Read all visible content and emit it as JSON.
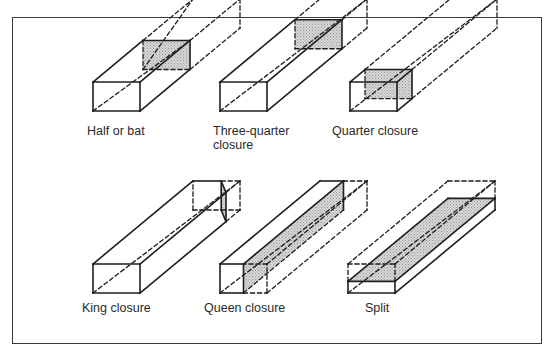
{
  "figure": {
    "type": "brick-cuts-diagram",
    "shade_color": "#c8c8c8",
    "line_color": "#1e1e1e",
    "items": [
      {
        "id": "half-or-bat",
        "label_lines": [
          "Half or bat"
        ]
      },
      {
        "id": "three-quarter-closure",
        "label_lines": [
          "Three-quarter",
          "closure"
        ]
      },
      {
        "id": "quarter-closure",
        "label_lines": [
          "Quarter closure"
        ]
      },
      {
        "id": "king-closure",
        "label_lines": [
          "King closure"
        ]
      },
      {
        "id": "queen-closure",
        "label_lines": [
          "Queen closure"
        ]
      },
      {
        "id": "split",
        "label_lines": [
          "Split"
        ]
      }
    ]
  }
}
